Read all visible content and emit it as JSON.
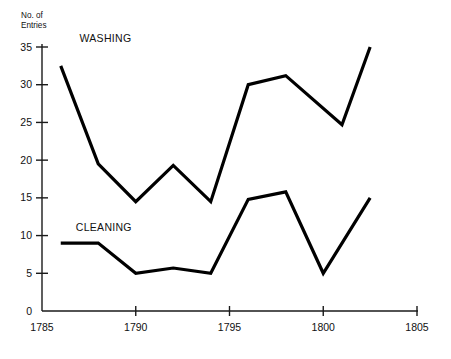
{
  "chart_data": {
    "type": "line",
    "title": "",
    "xlabel": "",
    "ylabel": "No. of Entries",
    "ylabel_lines": [
      "No. of",
      "Entries"
    ],
    "xlim": [
      1785,
      1805
    ],
    "ylim": [
      0,
      35
    ],
    "grid": false,
    "legend_position": "inline-labels",
    "xticks": [
      "1785",
      "1790",
      "1795",
      "1800",
      "1805"
    ],
    "xtick_values": [
      1785,
      1790,
      1795,
      1800,
      1805
    ],
    "yticks": [
      "0",
      "5",
      "10",
      "15",
      "20",
      "25",
      "30",
      "35"
    ],
    "ytick_values": [
      0,
      5,
      10,
      15,
      20,
      25,
      30,
      35
    ],
    "series": [
      {
        "name": "WASHING",
        "label": "WASHING",
        "color": "#000000",
        "x": [
          1786,
          1788,
          1790,
          1792,
          1794,
          1796,
          1798,
          1801,
          1802.5
        ],
        "values": [
          32.5,
          19.5,
          14.5,
          19.3,
          14.5,
          30,
          31.2,
          24.7,
          35
        ]
      },
      {
        "name": "CLEANING",
        "label": "CLEANING",
        "color": "#000000",
        "x": [
          1786,
          1788,
          1790,
          1792,
          1794,
          1796,
          1798,
          1800,
          1802.5
        ],
        "values": [
          9,
          9,
          5,
          5.7,
          5,
          14.8,
          15.8,
          5,
          15
        ]
      }
    ],
    "annotations": [
      {
        "text": "WASHING",
        "x": 1787.0,
        "y": 35.6
      },
      {
        "text": "CLEANING",
        "x": 1786.8,
        "y": 10.6
      }
    ]
  }
}
